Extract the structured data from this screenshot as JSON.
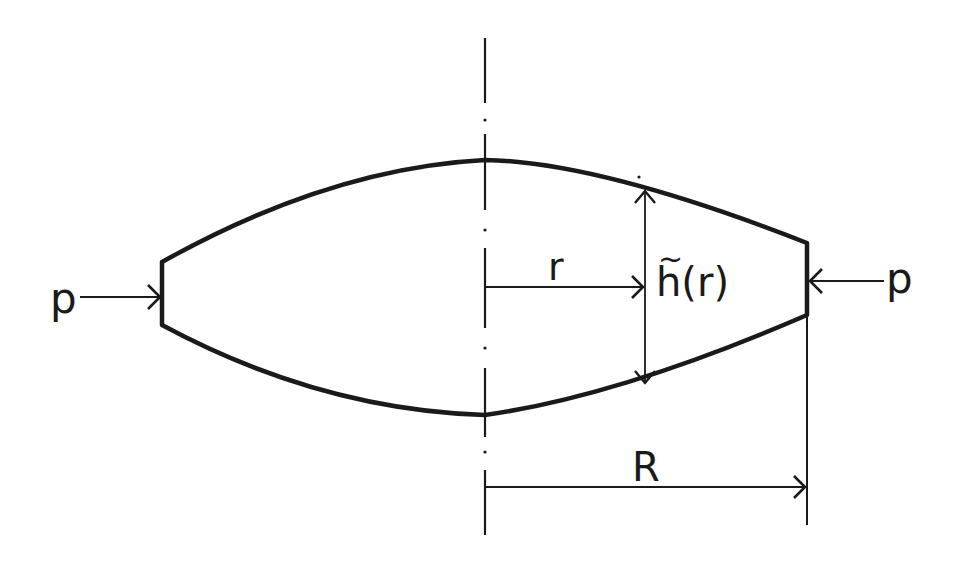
{
  "diagram": {
    "type": "axisymmetric lens-shaped body under radial edge pressure",
    "colors": {
      "stroke": "#1a1a1a",
      "background": "#ffffff"
    },
    "labels": {
      "pressure_left": "p",
      "pressure_right": "p",
      "radius_variable": "r",
      "thickness_function": "h(r)",
      "thickness_function_base": "h",
      "thickness_function_arg": "(r)",
      "thickness_tilde": "~",
      "outer_radius": "R"
    },
    "elements": [
      {
        "id": "symmetry-axis",
        "kind": "dash-dot centerline",
        "orientation": "vertical"
      },
      {
        "id": "body-outline",
        "kind": "closed profile",
        "shape": "biconvex lens with flat vertical edges"
      },
      {
        "id": "load-arrow-left",
        "kind": "arrow",
        "direction": "right",
        "label": "p"
      },
      {
        "id": "load-arrow-right",
        "kind": "arrow",
        "direction": "left",
        "label": "p"
      },
      {
        "id": "dimension-r",
        "kind": "arrow",
        "from": "axis",
        "label": "r"
      },
      {
        "id": "dimension-h",
        "kind": "double arrow",
        "orientation": "vertical",
        "label": "h(r) with tilde"
      },
      {
        "id": "dimension-R",
        "kind": "arrow",
        "from": "axis",
        "to": "outer edge",
        "label": "R"
      }
    ]
  }
}
